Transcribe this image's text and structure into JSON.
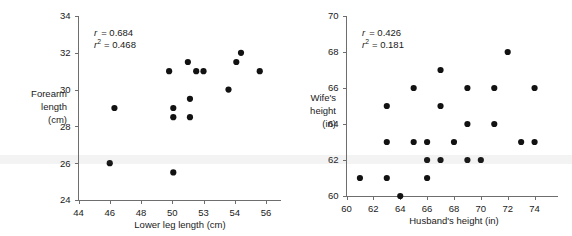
{
  "figure": {
    "panels": [
      {
        "name": "forearm-vs-lowerleg",
        "stats": {
          "r_label": "r",
          "r_value": "= 0.684",
          "r2_label": "r",
          "r2_sup": "2",
          "r2_value": "= 0.468"
        },
        "ylabel_lines": [
          "Forearm",
          "length",
          "(cm)"
        ],
        "xlabel": "Lower leg length (cm)"
      },
      {
        "name": "wife-vs-husband-height",
        "stats": {
          "r_label": "r",
          "r_value": "= 0.426",
          "r2_label": "r",
          "r2_sup": "2",
          "r2_value": "= 0.181"
        },
        "ylabel_lines": [
          "Wife's",
          "height",
          "(in)"
        ],
        "xlabel": "Husband's height (in)"
      }
    ]
  },
  "chart_data": [
    {
      "type": "scatter",
      "title": "",
      "xlabel": "Lower leg length (cm)",
      "ylabel": "Forearm length (cm)",
      "xlim": [
        44,
        56
      ],
      "ylim": [
        24,
        34
      ],
      "xticks": [
        44,
        46,
        48,
        50,
        53,
        54,
        56
      ],
      "xtick_labels": [
        "44",
        "46",
        "48",
        "50",
        "53",
        "54",
        "56"
      ],
      "yticks": [
        24,
        26,
        28,
        30,
        32,
        34
      ],
      "ytick_labels": [
        "24",
        "26",
        "28",
        "30",
        "32",
        "34"
      ],
      "grid": false,
      "legend": false,
      "annotations": [
        "r = 0.684",
        "r² = 0.468"
      ],
      "statistics": {
        "r": 0.684,
        "r_squared": 0.468
      },
      "points": [
        {
          "x": 46.0,
          "y": 26.0
        },
        {
          "x": 46.3,
          "y": 29.0
        },
        {
          "x": 49.8,
          "y": 31.0
        },
        {
          "x": 50.1,
          "y": 29.0
        },
        {
          "x": 50.1,
          "y": 28.5
        },
        {
          "x": 50.1,
          "y": 25.5
        },
        {
          "x": 51.5,
          "y": 31.5
        },
        {
          "x": 51.7,
          "y": 29.5
        },
        {
          "x": 51.7,
          "y": 28.5
        },
        {
          "x": 52.3,
          "y": 31.0
        },
        {
          "x": 53.0,
          "y": 31.0
        },
        {
          "x": 53.8,
          "y": 30.0
        },
        {
          "x": 54.1,
          "y": 31.5
        },
        {
          "x": 54.4,
          "y": 32.0
        },
        {
          "x": 55.6,
          "y": 31.0
        }
      ]
    },
    {
      "type": "scatter",
      "title": "",
      "xlabel": "Husband's height (in)",
      "ylabel": "Wife's height (in)",
      "xlim": [
        60,
        75
      ],
      "ylim": [
        60,
        70
      ],
      "xticks": [
        60,
        62,
        64,
        66,
        68,
        70,
        72,
        74
      ],
      "xtick_labels": [
        "60",
        "62",
        "64",
        "66",
        "68",
        "70",
        "72",
        "74"
      ],
      "yticks": [
        60,
        62,
        64,
        66,
        68,
        70
      ],
      "ytick_labels": [
        "60",
        "62",
        "64",
        "66",
        "68",
        "70"
      ],
      "grid": false,
      "legend": false,
      "annotations": [
        "r = 0.426",
        "r² = 0.181"
      ],
      "statistics": {
        "r": 0.426,
        "r_squared": 0.181
      },
      "points": [
        {
          "x": 61,
          "y": 61
        },
        {
          "x": 63,
          "y": 61
        },
        {
          "x": 63,
          "y": 63
        },
        {
          "x": 63,
          "y": 65
        },
        {
          "x": 64,
          "y": 60
        },
        {
          "x": 65,
          "y": 63
        },
        {
          "x": 65,
          "y": 66
        },
        {
          "x": 66,
          "y": 61
        },
        {
          "x": 66,
          "y": 62
        },
        {
          "x": 66,
          "y": 63
        },
        {
          "x": 67,
          "y": 62
        },
        {
          "x": 67,
          "y": 65
        },
        {
          "x": 67,
          "y": 67
        },
        {
          "x": 68,
          "y": 63
        },
        {
          "x": 69,
          "y": 62
        },
        {
          "x": 69,
          "y": 64
        },
        {
          "x": 69,
          "y": 66
        },
        {
          "x": 70,
          "y": 62
        },
        {
          "x": 71,
          "y": 64
        },
        {
          "x": 71,
          "y": 66
        },
        {
          "x": 72,
          "y": 68
        },
        {
          "x": 73,
          "y": 63
        },
        {
          "x": 74,
          "y": 63
        },
        {
          "x": 74,
          "y": 66
        }
      ]
    }
  ]
}
